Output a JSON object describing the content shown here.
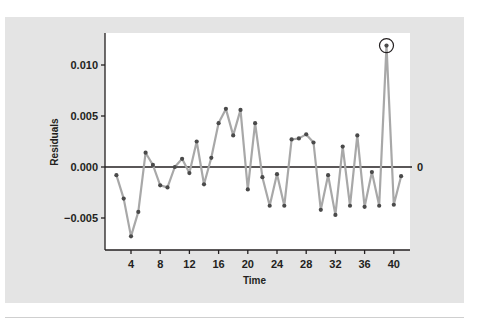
{
  "chart_data": {
    "type": "line",
    "title": "",
    "xlabel": "Time",
    "ylabel": "Residuals",
    "x": [
      2,
      3,
      4,
      5,
      6,
      7,
      8,
      9,
      10,
      11,
      12,
      13,
      14,
      15,
      16,
      17,
      18,
      19,
      20,
      21,
      22,
      23,
      24,
      25,
      26,
      27,
      28,
      29,
      30,
      31,
      32,
      33,
      34,
      35,
      36,
      37,
      38,
      39,
      40,
      41
    ],
    "series": [
      {
        "name": "Residuals",
        "values": [
          -0.0008,
          -0.0031,
          -0.0068,
          -0.0044,
          0.0014,
          0.0002,
          -0.0018,
          -0.002,
          0.0,
          0.0008,
          -0.0006,
          0.0025,
          -0.0017,
          0.0009,
          0.0043,
          0.0057,
          0.0031,
          0.0056,
          -0.0022,
          0.0043,
          -0.001,
          -0.0038,
          -0.0007,
          -0.0038,
          0.0027,
          0.0028,
          0.0032,
          0.0024,
          -0.0042,
          -0.0008,
          -0.0047,
          0.002,
          -0.0038,
          0.0031,
          -0.0039,
          -0.0005,
          -0.0038,
          0.0119,
          -0.0037,
          -0.0009
        ]
      }
    ],
    "xticks": [
      4,
      8,
      12,
      16,
      20,
      24,
      28,
      32,
      36,
      40
    ],
    "xtick_labels": [
      "4",
      "8",
      "12",
      "16",
      "20",
      "24",
      "28",
      "32",
      "36",
      "40"
    ],
    "yticks": [
      0.01,
      0.005,
      0.0,
      -0.005
    ],
    "ytick_labels": [
      "0.010",
      "0.005",
      "0.000",
      "−0.005"
    ],
    "xlim": [
      0.5,
      42.5
    ],
    "ylim": [
      -0.0081,
      0.0131
    ],
    "grid": false,
    "reference_line": {
      "y": 0,
      "label": "0"
    },
    "highlighted_point": {
      "x": 39,
      "value": 0.0119,
      "marker": "circle"
    },
    "colors": {
      "line": "#a8a8a8",
      "marker": "#4a4a4a",
      "axis": "#231f20",
      "panel": "#e4e4e4",
      "plot_bg": "#ffffff"
    }
  }
}
